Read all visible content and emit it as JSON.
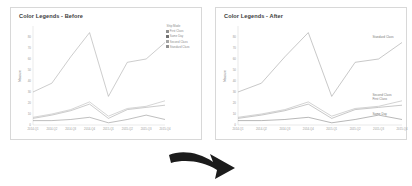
{
  "figure": {
    "background": "#ffffff",
    "arrow_icon": "curved-down-right-arrow",
    "arrow_color": "#1b1b1b"
  },
  "panels": {
    "before": {
      "title": "Color Legends - Before",
      "legend": {
        "title": "Ship Mode",
        "position": "right",
        "entries": [
          {
            "label": "First Class",
            "color": "#8f8f8f"
          },
          {
            "label": "Same Day",
            "color": "#707070"
          },
          {
            "label": "Second Class",
            "color": "#a5a5a5"
          },
          {
            "label": "Standard Class",
            "color": "#909090"
          }
        ]
      },
      "inline_labels": []
    },
    "after": {
      "title": "Color Legends - After",
      "legend": {
        "title": "",
        "position": "none",
        "entries": []
      },
      "inline_labels": [
        {
          "label": "Standard Class",
          "color": "#7c7c7c"
        },
        {
          "label": "Second Class",
          "color": "#7c7c7c"
        },
        {
          "label": "First Class",
          "color": "#7c7c7c"
        },
        {
          "label": "Same Day",
          "color": "#7c7c7c"
        }
      ]
    }
  },
  "chart_data": {
    "type": "line",
    "title": "Color Legends - Before",
    "xlabel": "",
    "ylabel": "Measure",
    "ylim": [
      0,
      90
    ],
    "yticks": [
      0,
      10,
      20,
      30,
      40,
      50,
      60,
      70,
      80
    ],
    "grid": false,
    "legend_position": "right",
    "categories": [
      "2014-Q1",
      "2014-Q2",
      "2014-Q3",
      "2014-Q4",
      "2015-Q1",
      "2015-Q2",
      "2015-Q3",
      "2015-Q4"
    ],
    "series": [
      {
        "name": "Standard Class",
        "color": "#909090",
        "values": [
          30,
          38,
          62,
          84,
          26,
          57,
          60,
          75
        ]
      },
      {
        "name": "Second Class",
        "color": "#a5a5a5",
        "values": [
          7,
          10,
          14,
          21,
          8,
          15,
          17,
          22
        ]
      },
      {
        "name": "First Class",
        "color": "#8f8f8f",
        "values": [
          6,
          9,
          13,
          19,
          6,
          14,
          16,
          18
        ]
      },
      {
        "name": "Same Day",
        "color": "#707070",
        "values": [
          4,
          4,
          5,
          7,
          2,
          5,
          9,
          5
        ]
      }
    ]
  }
}
